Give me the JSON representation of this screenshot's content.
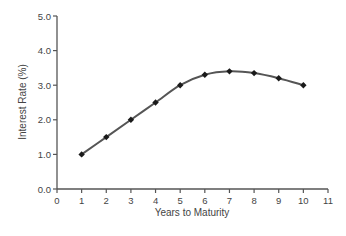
{
  "chart_data": {
    "type": "line",
    "title": "",
    "xlabel": "Years to Maturity",
    "ylabel": "Interest Rate (%)",
    "x": [
      1,
      2,
      3,
      4,
      5,
      6,
      7,
      8,
      9,
      10
    ],
    "series": [
      {
        "name": "Yield curve",
        "values": [
          1.0,
          1.5,
          2.0,
          2.5,
          3.0,
          3.3,
          3.4,
          3.35,
          3.2,
          3.0
        ]
      }
    ],
    "xlim": [
      0,
      11
    ],
    "ylim": [
      0,
      5
    ],
    "xticks": [
      0,
      1,
      2,
      3,
      4,
      5,
      6,
      7,
      8,
      9,
      10,
      11
    ],
    "yticks": [
      "0.0",
      "1.0",
      "2.0",
      "3.0",
      "4.0",
      "5.0"
    ],
    "grid": false,
    "legend": "none",
    "marker": "diamond",
    "colors": {
      "line": "#555555",
      "marker": "#1a1a1a",
      "axis": "#555555",
      "text": "#444444"
    }
  }
}
